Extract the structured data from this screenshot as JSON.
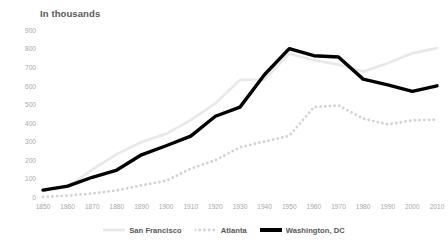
{
  "chart_data": {
    "type": "line",
    "title": "In thousands",
    "xlabel": "",
    "ylabel": "",
    "xlim": [
      1850,
      2010
    ],
    "ylim": [
      0,
      900
    ],
    "ytick_step": 100,
    "grid": false,
    "legend_position": "bottom",
    "x": [
      1850,
      1860,
      1870,
      1880,
      1890,
      1900,
      1910,
      1920,
      1930,
      1940,
      1950,
      1960,
      1970,
      1980,
      1990,
      2000,
      2010
    ],
    "xtick_labels": [
      "1850",
      "1860",
      "1870",
      "1880",
      "1890",
      "1900",
      "1910",
      "1920",
      "1930",
      "1940",
      "1950",
      "1960",
      "1970",
      "1980",
      "1990",
      "2000",
      "2010"
    ],
    "ytick_labels": [
      "0",
      "100",
      "200",
      "300",
      "400",
      "500",
      "600",
      "700",
      "800",
      "900"
    ],
    "ytick_values": [
      0,
      100,
      200,
      300,
      400,
      500,
      600,
      700,
      800,
      900
    ],
    "series": [
      {
        "name": "San Francisco",
        "style": "solid",
        "color": "#e8e8e8",
        "width": 2.6,
        "values": [
          35,
          57,
          150,
          234,
          299,
          343,
          417,
          507,
          634,
          635,
          775,
          740,
          716,
          679,
          724,
          777,
          805
        ]
      },
      {
        "name": "Atlanta",
        "style": "dotted",
        "color": "#d2d2d2",
        "width": 2.8,
        "values": [
          3,
          10,
          22,
          38,
          66,
          90,
          155,
          201,
          271,
          302,
          332,
          487,
          497,
          425,
          394,
          416,
          420
        ]
      },
      {
        "name": "Washington, DC",
        "style": "solid",
        "color": "#000000",
        "width": 3.4,
        "values": [
          40,
          61,
          109,
          148,
          230,
          279,
          331,
          438,
          487,
          663,
          802,
          764,
          757,
          638,
          607,
          572,
          602
        ]
      }
    ]
  },
  "legend": {
    "items": [
      {
        "label": "San Francisco",
        "icon": "solid-line-swatch"
      },
      {
        "label": "Atlanta",
        "icon": "dotted-line-swatch"
      },
      {
        "label": "Washington, DC",
        "icon": "bold-line-swatch"
      }
    ]
  }
}
